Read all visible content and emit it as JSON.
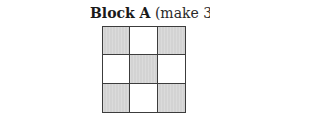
{
  "block": {
    "name": "Block A",
    "note": "(make 34)",
    "colors": {
      "shaded": "#d3d3d3",
      "plain": "#ffffff",
      "border": "#3c3c3c"
    },
    "rows": [
      [
        "shaded",
        "plain",
        "shaded"
      ],
      [
        "plain",
        "shaded",
        "plain"
      ],
      [
        "shaded",
        "plain",
        "shaded"
      ]
    ]
  }
}
